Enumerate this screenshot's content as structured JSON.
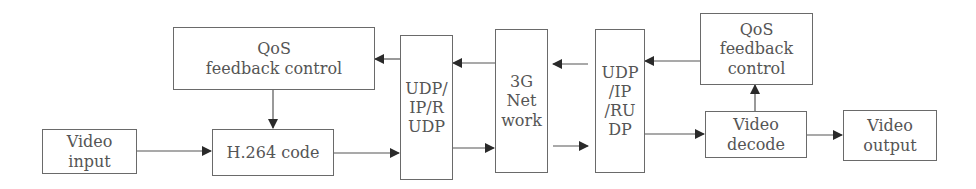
{
  "diagram": {
    "title": "",
    "nodes": {
      "qos_left": {
        "lines": [
          "QoS",
          "feedback control"
        ]
      },
      "video_input": {
        "lines": [
          "Video",
          "input"
        ]
      },
      "h264": {
        "lines": [
          "H.264 code"
        ]
      },
      "udp_left": {
        "lines": [
          "UDP/",
          "IP/R",
          "UDP"
        ]
      },
      "network": {
        "lines": [
          "3G",
          "Net",
          "work"
        ]
      },
      "udp_right": {
        "lines": [
          "UDP",
          "/IP",
          "/RU",
          "DP"
        ]
      },
      "qos_right": {
        "lines": [
          "QoS",
          "feedback",
          "control"
        ]
      },
      "video_decode": {
        "lines": [
          "Video",
          "decode"
        ]
      },
      "video_output": {
        "lines": [
          "Video",
          "output"
        ]
      }
    },
    "edges": [
      {
        "from": "video_input",
        "to": "h264"
      },
      {
        "from": "qos_left",
        "to": "h264"
      },
      {
        "from": "h264",
        "to": "udp_left"
      },
      {
        "from": "udp_left",
        "to": "qos_left"
      },
      {
        "from": "network",
        "to": "udp_left"
      },
      {
        "from": "udp_left",
        "to": "network"
      },
      {
        "from": "udp_right",
        "to": "network"
      },
      {
        "from": "network",
        "to": "udp_right"
      },
      {
        "from": "qos_right",
        "to": "udp_right"
      },
      {
        "from": "udp_right",
        "to": "video_decode"
      },
      {
        "from": "video_decode",
        "to": "qos_right"
      },
      {
        "from": "video_decode",
        "to": "video_output"
      }
    ],
    "colors": {
      "line": "#4a4a4a",
      "box_border": "#6a6a6a",
      "text": "#555555",
      "background": "#ffffff"
    }
  }
}
